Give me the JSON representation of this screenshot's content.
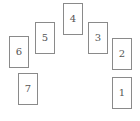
{
  "diagram": {
    "type": "card-spread",
    "layout": "horseshoe",
    "cards": [
      {
        "label": "1",
        "x": 112,
        "y": 77
      },
      {
        "label": "2",
        "x": 112,
        "y": 38
      },
      {
        "label": "3",
        "x": 88,
        "y": 22
      },
      {
        "label": "4",
        "x": 63,
        "y": 3
      },
      {
        "label": "5",
        "x": 35,
        "y": 22
      },
      {
        "label": "6",
        "x": 9,
        "y": 36
      },
      {
        "label": "7",
        "x": 18,
        "y": 73
      }
    ]
  }
}
